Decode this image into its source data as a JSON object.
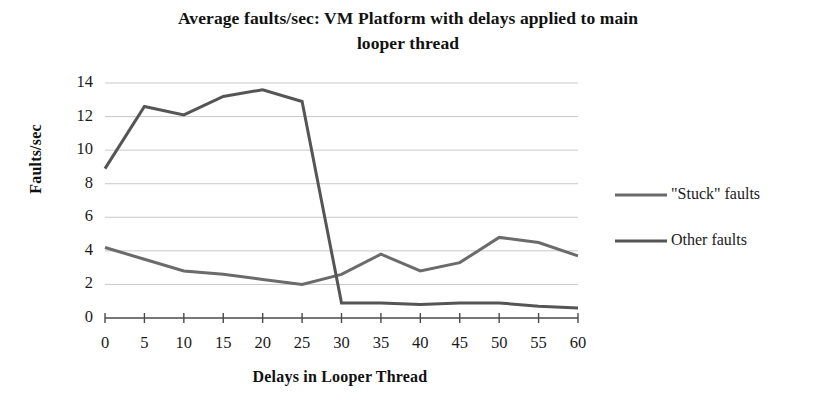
{
  "chart_data": {
    "type": "line",
    "title": "Average faults/sec: VM Platform with delays applied to main looper thread",
    "title_line1": "Average faults/sec: VM Platform with delays applied to main",
    "title_line2": "looper thread",
    "xlabel": "Delays in Looper Thread",
    "ylabel": "Faults/sec",
    "x": [
      0,
      5,
      10,
      15,
      20,
      25,
      30,
      35,
      40,
      45,
      50,
      55,
      60
    ],
    "categories": [
      "0",
      "5",
      "10",
      "15",
      "20",
      "25",
      "30",
      "35",
      "40",
      "45",
      "50",
      "55",
      "60"
    ],
    "xlim": [
      0,
      60
    ],
    "ylim": [
      0,
      14
    ],
    "ytick_labels": [
      "14",
      "12",
      "10",
      "8",
      "6",
      "4",
      "2",
      "0"
    ],
    "yticks": [
      14,
      12,
      10,
      8,
      6,
      4,
      2,
      0
    ],
    "grid": "horizontal",
    "legend_position": "right",
    "series": [
      {
        "name": "\"Stuck\" faults",
        "color": "#6b6b6b",
        "values": [
          4.2,
          3.5,
          2.8,
          2.6,
          2.3,
          2.0,
          2.6,
          3.8,
          2.8,
          3.3,
          4.8,
          4.5,
          3.7
        ]
      },
      {
        "name": "Other faults",
        "color": "#555555",
        "values": [
          8.9,
          12.6,
          12.1,
          13.2,
          13.6,
          12.9,
          0.9,
          0.9,
          0.8,
          0.9,
          0.9,
          0.7,
          0.6
        ]
      }
    ]
  },
  "legend": {
    "items": [
      {
        "label": "\"Stuck\" faults"
      },
      {
        "label": "Other faults"
      }
    ]
  }
}
